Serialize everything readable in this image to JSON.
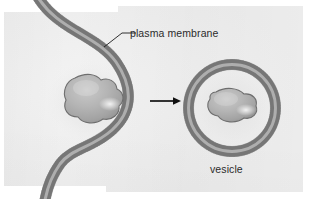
{
  "figure": {
    "type": "biology-illustration",
    "background_color": "#efefef",
    "paper_color": "#ffffff",
    "ink_color": "#7d7d7d",
    "text_color": "#2b2b2b",
    "arrow_color": "#111111"
  },
  "labels": {
    "plasma_membrane": "plasma membrane",
    "vesicle": "vesicle"
  },
  "elements": {
    "membrane_name": "plasma-membrane-bilayer",
    "left_particle_name": "engulfed-particle",
    "vesicle_name": "vesicle-bilayer",
    "vesicle_particle_name": "vesicle-contents-particle",
    "arrow_name": "process-arrow",
    "leader_line_name": "plasma-membrane-leader-line"
  },
  "geometry": {
    "membrane_path": "M 36 -6 C 56 30, 96 34, 116 62 C 134 88, 132 112, 112 130 C 92 148, 72 148, 60 164 C 50 178, 46 192, 44 206",
    "vesicle_center_x": 232,
    "vesicle_center_y": 108,
    "vesicle_radius": 49,
    "arrow_x1": 150,
    "arrow_y1": 101,
    "arrow_x2": 178,
    "arrow_y2": 101,
    "leader_x1": 104,
    "leader_y1": 47,
    "leader_x2": 122,
    "leader_y2": 33,
    "leader_x3": 135,
    "leader_y3": 33
  }
}
